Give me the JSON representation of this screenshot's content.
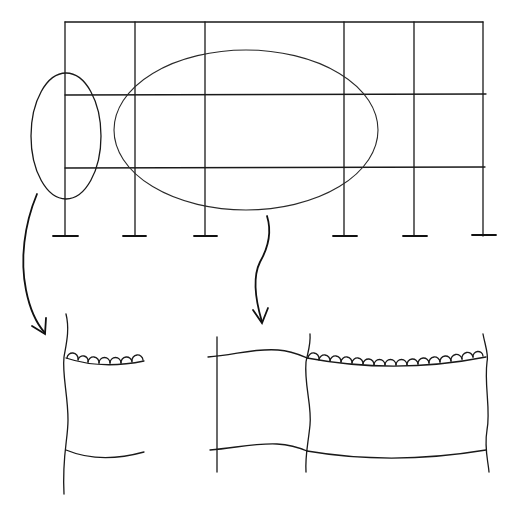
{
  "figure": {
    "description": "Sketch of a multi-bay, two-storey structural frame with highlighted regions and enlarged details of beam-column connections",
    "stroke_color": "#1a1a1a",
    "background": "#ffffff"
  },
  "frame": {
    "columns_x": [
      65,
      135,
      205,
      344,
      414,
      483
    ],
    "beams_y": [
      22,
      95,
      168
    ],
    "base_y": 236,
    "supports": 6,
    "support_type": "fixed base (T-foot)"
  },
  "highlights": [
    {
      "id": "left-ellipse",
      "label": "exterior column region",
      "cx": 65,
      "cy": 134,
      "rx": 35,
      "ry": 63
    },
    {
      "id": "center-ellipse",
      "label": "interior beam-column region",
      "cx": 245,
      "cy": 132,
      "rx": 132,
      "ry": 80
    }
  ],
  "details": [
    {
      "id": "detail-left",
      "label": "enlarged exterior joint (deformed) with hinge markings"
    },
    {
      "id": "detail-right",
      "label": "enlarged interior bays (deformed) with hinge markings along beam"
    }
  ]
}
